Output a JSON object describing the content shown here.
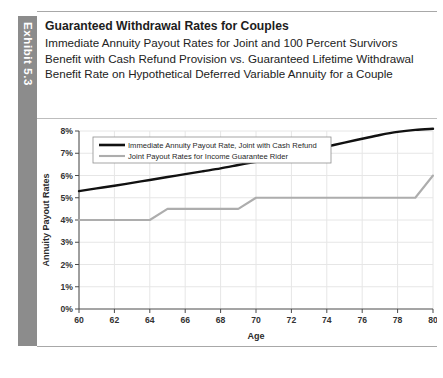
{
  "exhibit": {
    "tab_label": "Exhibit 5.3"
  },
  "header": {
    "title": "Guaranteed Withdrawal Rates for Couples",
    "subtitle": "Immediate Annuity Payout Rates for Joint and 100 Percent Survivors Benefit with Cash Refund Provision vs. Guaranteed Lifetime Withdrawal Benefit Rate on Hypothetical Deferred Variable Annuity for a Couple"
  },
  "chart_data": {
    "type": "line",
    "title": "Guaranteed Withdrawal Rates for Couples",
    "xlabel": "Age",
    "ylabel": "Annuity Payout Rates",
    "xlim": [
      60,
      80
    ],
    "ylim": [
      0,
      8
    ],
    "xticks": [
      60,
      62,
      64,
      66,
      68,
      70,
      72,
      74,
      76,
      78,
      80
    ],
    "xtick_labels": [
      "60",
      "62",
      "64",
      "66",
      "68",
      "70",
      "72",
      "74",
      "76",
      "78",
      "80"
    ],
    "yticks": [
      0,
      1,
      2,
      3,
      4,
      5,
      6,
      7,
      8
    ],
    "ytick_labels": [
      "0%",
      "1%",
      "2%",
      "3%",
      "4%",
      "5%",
      "6%",
      "7%",
      "8%"
    ],
    "grid": true,
    "legend_position": "upper left",
    "x": [
      60,
      61,
      62,
      63,
      64,
      65,
      66,
      67,
      68,
      69,
      70,
      71,
      72,
      73,
      74,
      75,
      76,
      77,
      78,
      79,
      80
    ],
    "series": [
      {
        "name": "Immediate Annuity Payout Rate, Joint with Cash Refund",
        "color": "#111111",
        "style": "smooth",
        "values": [
          5.3,
          5.42,
          5.54,
          5.67,
          5.8,
          5.93,
          6.06,
          6.19,
          6.32,
          6.47,
          6.62,
          6.78,
          6.95,
          7.12,
          7.3,
          7.48,
          7.65,
          7.82,
          7.96,
          8.05,
          8.1
        ]
      },
      {
        "name": "Joint Payout Rates for Income Guarantee Rider",
        "color": "#adadad",
        "style": "step",
        "values": [
          4.0,
          4.0,
          4.0,
          4.0,
          4.0,
          4.5,
          4.5,
          4.5,
          4.5,
          4.5,
          5.0,
          5.0,
          5.0,
          5.0,
          5.0,
          5.0,
          5.0,
          5.0,
          5.0,
          5.0,
          6.0
        ]
      }
    ]
  },
  "colors": {
    "tab_background": "#8c8c8c",
    "series_primary": "#111111",
    "series_secondary": "#adadad",
    "rule": "#a8a8a8"
  }
}
